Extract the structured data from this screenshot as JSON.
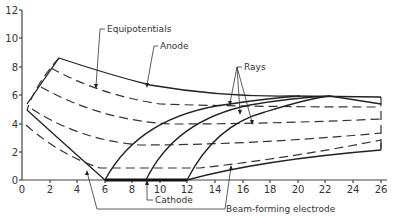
{
  "diagram": {
    "type": "electrode-geometry",
    "colors": {
      "ink": "#222222",
      "text": "#333333",
      "background": "#ffffff"
    },
    "axes": {
      "x_ticks": [
        "0",
        "2",
        "4",
        "6",
        "8",
        "10",
        "12",
        "14",
        "16",
        "18",
        "20",
        "22",
        "24",
        "26"
      ],
      "y_ticks": [
        "0",
        "2",
        "4",
        "6",
        "8",
        "10",
        "12"
      ],
      "x_range": [
        0,
        27
      ],
      "y_range": [
        0,
        12
      ]
    },
    "labels": {
      "equipotentials": "Equipotentials",
      "anode": "Anode",
      "rays": "Rays",
      "cathode": "Cathode",
      "beam_forming_electrode": "Beam-forming electrode"
    },
    "elements": {
      "cathode_span": [
        6,
        12
      ],
      "anode_peak": [
        2.7,
        8.6
      ],
      "beam_forming_start": [
        0.4,
        3.5
      ],
      "equipotential_count": 4,
      "ray_count": 3,
      "ray_starts_x": [
        6,
        9,
        12
      ]
    }
  }
}
